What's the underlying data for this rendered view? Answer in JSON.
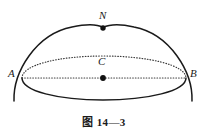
{
  "figure": {
    "caption": "图 14—3",
    "background_color": "#ffffff",
    "stroke_color": "#1a1a1a",
    "dotted_stroke_color": "#3a3a3a",
    "labels": {
      "apex": "N",
      "left_end": "A",
      "right_end": "B",
      "center": "C"
    },
    "points": [
      {
        "name": "N",
        "x": 103,
        "y": 28,
        "filled": true
      },
      {
        "name": "C",
        "x": 103,
        "y": 78,
        "filled": true
      }
    ],
    "geometry": {
      "type": "hemisphere-with-equator",
      "dome_apex": {
        "x": 103,
        "y": 28
      },
      "left_vertex": {
        "x": 22,
        "y": 78
      },
      "right_vertex": {
        "x": 186,
        "y": 78
      },
      "ellipse_center": {
        "x": 103,
        "y": 78
      },
      "ellipse_semi_major": 82,
      "ellipse_semi_minor": 22,
      "dome_radius_x": 82,
      "dome_radius_y": 50
    }
  }
}
